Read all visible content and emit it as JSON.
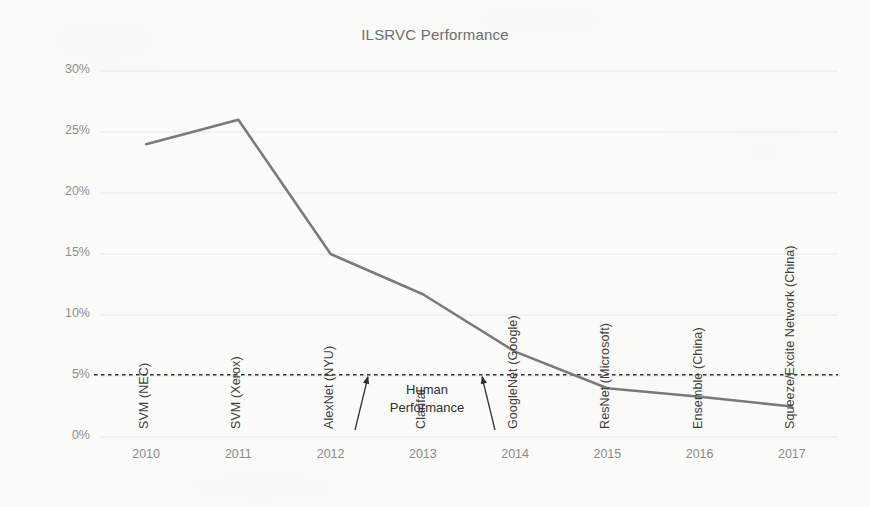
{
  "chart_data": {
    "type": "line",
    "title": "ILSRVC Performance",
    "xlabel": "",
    "ylabel": "Top 5 Error %",
    "categories": [
      "2010",
      "2011",
      "2012",
      "2013",
      "2014",
      "2015",
      "2016",
      "2017"
    ],
    "values": [
      24.0,
      26.0,
      15.0,
      11.7,
      7.0,
      4.0,
      3.3,
      2.5
    ],
    "ylim": [
      0,
      30
    ],
    "ytick_labels": [
      "0%",
      "5%",
      "10%",
      "15%",
      "20%",
      "25%",
      "30%"
    ],
    "ytick_values": [
      0,
      5,
      10,
      15,
      20,
      25,
      30
    ],
    "grid": true,
    "legend": "none",
    "line_color": "#7a7a7a",
    "point_labels": [
      "SVM (NEC)",
      "SVM (Xerox)",
      "AlexNet (NYU)",
      "Clarifai",
      "GoogleNet (Google)",
      "ResNet (Microsoft)",
      "Ensemble (China)",
      "Squeeze/Excite Network (China)"
    ],
    "annotations": [
      {
        "label_line1": "Human",
        "label_line2": "Performance",
        "value": 5.1,
        "style": "dashed-threshold-line",
        "color": "#2f2f2f"
      }
    ]
  }
}
